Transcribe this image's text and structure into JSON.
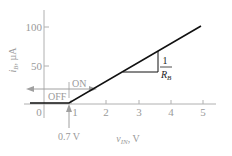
{
  "diagram": {
    "type": "transfer-characteristic",
    "y_axis": {
      "label_main": "i",
      "label_sub": "B",
      "label_unit": ", µA",
      "ticks": [
        {
          "value": 50,
          "label": "50"
        },
        {
          "value": 100,
          "label": "100"
        }
      ]
    },
    "x_axis": {
      "label_main": "v",
      "label_sub": "IN",
      "label_unit": ", V",
      "ticks": [
        {
          "value": 0,
          "label": "0"
        },
        {
          "value": 1,
          "label": "1"
        },
        {
          "value": 2,
          "label": "2"
        },
        {
          "value": 3,
          "label": "3"
        },
        {
          "value": 4,
          "label": "4"
        },
        {
          "value": 5,
          "label": "5"
        }
      ]
    },
    "regions": {
      "off_label": "OFF",
      "on_label": "ON"
    },
    "threshold": {
      "label": "0.7 V",
      "value": 0.7
    },
    "slope": {
      "numerator": "1",
      "denominator_main": "R",
      "denominator_sub": "B"
    },
    "colors": {
      "curve": "#111111",
      "axis": "#a8a8a8",
      "text": "#9a9a9a",
      "arrow": "#a0a0a0"
    }
  }
}
